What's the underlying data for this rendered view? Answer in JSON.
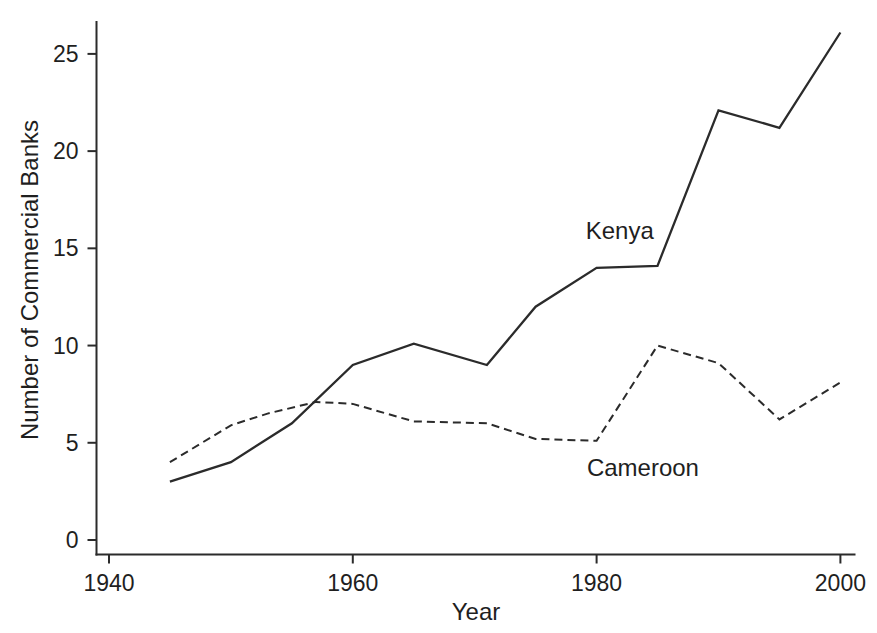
{
  "figure": {
    "background": "#ffffff",
    "line_color": "#2b2b2b",
    "text_color": "#1f1f1f"
  },
  "chart_data": {
    "type": "line",
    "title": "",
    "xlabel": "Year",
    "ylabel": "Number of Commercial Banks",
    "xlim": [
      1939,
      2001.3
    ],
    "ylim": [
      0,
      26.8
    ],
    "x_ticks": [
      "1940",
      "1960",
      "1980",
      "2000"
    ],
    "x_tick_values": [
      1940,
      1960,
      1980,
      2000
    ],
    "y_ticks": [
      "0",
      "5",
      "10",
      "15",
      "20",
      "25"
    ],
    "y_tick_values": [
      0,
      5,
      10,
      15,
      20,
      25
    ],
    "grid": false,
    "legend_position": "inline-annotations",
    "series": [
      {
        "name": "Kenya",
        "line_style": "solid",
        "x": [
          1945,
          1950,
          1955,
          1960,
          1965,
          1971,
          1975,
          1980,
          1985,
          1990,
          1995,
          2000
        ],
        "values": [
          3,
          4,
          6,
          9,
          10.1,
          9,
          12,
          14,
          14.1,
          22.1,
          21.2,
          26.1
        ]
      },
      {
        "name": "Cameroon",
        "line_style": "dashed",
        "x": [
          1945,
          1950,
          1953,
          1957,
          1960,
          1965,
          1971,
          1975,
          1980,
          1985,
          1990,
          1995,
          2000
        ],
        "values": [
          4,
          5.9,
          6.5,
          7.1,
          7,
          6.1,
          6,
          5.2,
          5.1,
          10,
          9.1,
          6.2,
          8.1
        ]
      }
    ],
    "annotations": [
      {
        "text": "Kenya",
        "x": 1981.9,
        "y": 15.9
      },
      {
        "text": "Cameroon",
        "x": 1983.8,
        "y": 3.7
      }
    ]
  }
}
